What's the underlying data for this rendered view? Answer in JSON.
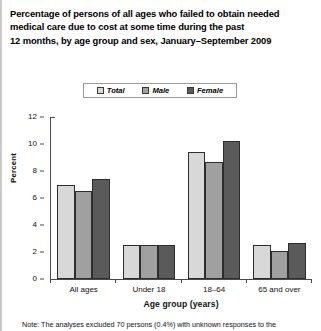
{
  "title": {
    "line1": "Percentage of persons of all ages who failed to obtain needed",
    "line2": "medical care due to cost at some time during the past",
    "line3": "12 months, by age group and sex, January–September 2009"
  },
  "legend": {
    "items": [
      {
        "label": "Total",
        "color": "#d8d8d8"
      },
      {
        "label": "Male",
        "color": "#a0a0a0"
      },
      {
        "label": "Female",
        "color": "#5a5a5a"
      }
    ]
  },
  "axes": {
    "ylabel": "Percent",
    "xlabel": "Age group (years)",
    "yticks": [
      "0",
      "2",
      "4",
      "6",
      "8",
      "10",
      "12"
    ]
  },
  "footnote": "Note: The analyses excluded 70 persons (0.4%) with unknown responses to the",
  "chart_data": {
    "type": "bar",
    "title": "Percentage of persons of all ages who failed to obtain needed medical care due to cost at some time during the past 12 months, by age group and sex, January–September 2009",
    "xlabel": "Age group (years)",
    "ylabel": "Percent",
    "ylim": [
      0,
      12
    ],
    "ytick_interval": 2,
    "grid": false,
    "legend_position": "top-center",
    "categories": [
      "All ages",
      "Under 18",
      "18–64",
      "65 and over"
    ],
    "series": [
      {
        "name": "Total",
        "color": "#d8d8d8",
        "values": [
          7.0,
          2.5,
          9.4,
          2.5
        ]
      },
      {
        "name": "Male",
        "color": "#a0a0a0",
        "values": [
          6.5,
          2.5,
          8.7,
          2.1
        ]
      },
      {
        "name": "Female",
        "color": "#5a5a5a",
        "values": [
          7.4,
          2.5,
          10.2,
          2.7
        ]
      }
    ]
  }
}
